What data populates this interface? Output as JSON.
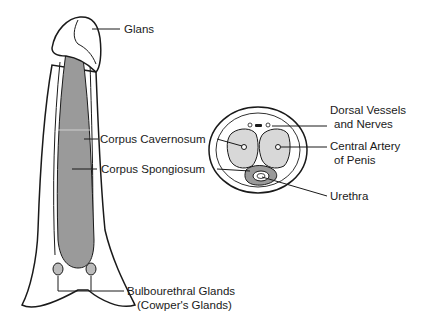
{
  "diagram": {
    "longitudinal_view": {
      "labels": {
        "glans": "Glans",
        "corpus_cavernosum": "Corpus Cavernosum",
        "corpus_spongiosum": "Corpus Spongiosum",
        "bulbourethral_1": "Bulbourethral Glands",
        "bulbourethral_2": "(Cowper's Glands)"
      }
    },
    "cross_section": {
      "labels": {
        "dorsal_1": "Dorsal Vessels",
        "dorsal_2": "and Nerves",
        "artery_1": "Central Artery",
        "artery_2": "of Penis",
        "urethra": "Urethra"
      }
    },
    "colors": {
      "outline": "#1a1a1a",
      "spongiosum_fill": "#9a9a9a",
      "cavernosum_fill": "#d8d8d8"
    }
  }
}
